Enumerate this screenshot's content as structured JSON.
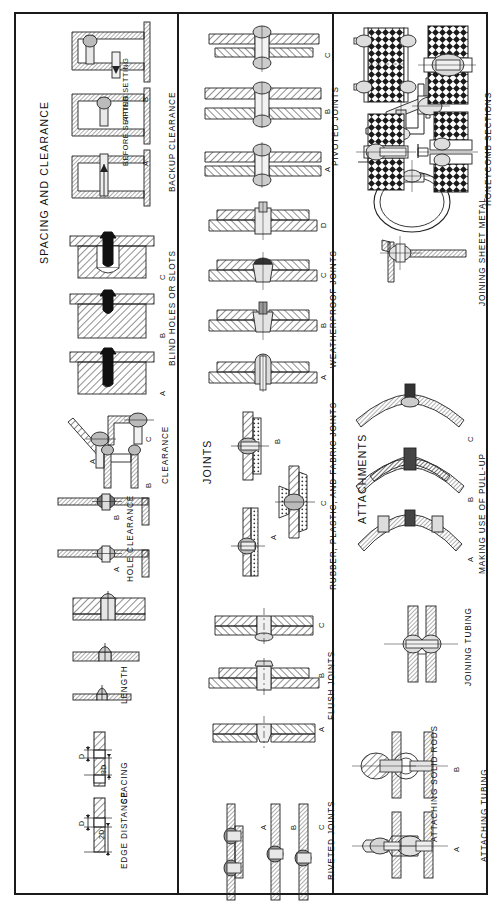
{
  "document": {
    "orientation": "rotated-90-ccw",
    "background_color": "#ffffff",
    "line_color": "#1a1a1a"
  },
  "panels": [
    {
      "id": "spacing-and-clearance",
      "title": "SPACING AND CLEARANCE",
      "groups": [
        {
          "id": "edge-distance",
          "label": "EDGE DISTANCE",
          "dimensions": [
            "D",
            "2D"
          ],
          "items": []
        },
        {
          "id": "spacing",
          "label": "SPACING",
          "dimensions": [
            "D",
            "3D"
          ],
          "items": []
        },
        {
          "id": "length",
          "label": "LENGTH",
          "items": []
        },
        {
          "id": "hole-clearance",
          "label": "HOLE CLEARANCE",
          "items": [
            "A",
            "B"
          ]
        },
        {
          "id": "clearance",
          "label": "CLEARANCE",
          "items": [
            "A",
            "B",
            "C"
          ]
        },
        {
          "id": "blind-holes-or-slots",
          "label": "BLIND HOLES OR SLOTS",
          "items": [
            "A",
            "B",
            "C"
          ]
        },
        {
          "id": "backup-clearance",
          "label": "BACKUP CLEARANCE",
          "items": [
            "A",
            "B"
          ],
          "notes": [
            "BEFORE SETTING",
            "AFTER SETTING"
          ]
        }
      ]
    },
    {
      "id": "joints",
      "title": "JOINTS",
      "groups": [
        {
          "id": "riveted-joints",
          "label": "RIVETED JOINTS",
          "items": [
            "A",
            "B",
            "C"
          ]
        },
        {
          "id": "flush-joints",
          "label": "FLUSH JOINTS",
          "items": [
            "A",
            "B",
            "C"
          ]
        },
        {
          "id": "rubber-plastic-fabric-joints",
          "label": "RUBBER, PLASTIC, AND FABRIC JOINTS",
          "items": [
            "A",
            "B",
            "C"
          ]
        },
        {
          "id": "weatherproof-joints",
          "label": "WEATHERPROOF JOINTS",
          "items": [
            "A",
            "B",
            "C",
            "D"
          ]
        },
        {
          "id": "pivoted-joints",
          "label": "PIVOTED JOINTS",
          "items": [
            "A",
            "B",
            "C"
          ]
        }
      ]
    },
    {
      "id": "attachments",
      "title": "ATTACHMENTS",
      "groups": [
        {
          "id": "attaching-tubing",
          "label": "ATTACHING TUBING",
          "items": [
            "A",
            "B"
          ]
        },
        {
          "id": "attaching-solid-rods",
          "label": "ATTACHING SOLID RODS",
          "items": []
        },
        {
          "id": "joining-tubing",
          "label": "JOINING TUBING",
          "items": []
        },
        {
          "id": "making-use-of-pull-up",
          "label": "MAKING USE OF PULL-UP",
          "items": [
            "A",
            "B",
            "C"
          ]
        },
        {
          "id": "joining-sheet-metal",
          "label": "JOINING SHEET METAL",
          "items": []
        },
        {
          "id": "honeycomb-sections",
          "label": "HONEYCOMB SECTIONS",
          "items": []
        }
      ]
    }
  ]
}
